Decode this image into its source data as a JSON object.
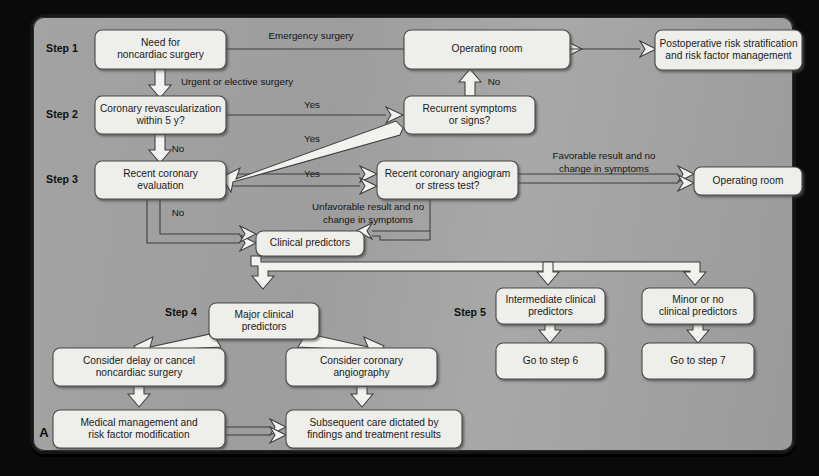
{
  "figure": {
    "panel_label": "A",
    "background_color": "#a0a0a0",
    "box_fill": "#eeeeea",
    "box_stroke": "#4a4a4a",
    "arrow_fill": "#f2f2ee"
  },
  "steps": [
    {
      "id": "step1",
      "label": "Step 1",
      "x": 62,
      "y": 49
    },
    {
      "id": "step2",
      "label": "Step 2",
      "x": 62,
      "y": 115
    },
    {
      "id": "step3",
      "label": "Step 3",
      "x": 62,
      "y": 180
    },
    {
      "id": "step4",
      "label": "Step 4",
      "x": 181,
      "y": 313
    },
    {
      "id": "step5",
      "label": "Step 5",
      "x": 470,
      "y": 313
    }
  ],
  "nodes": [
    {
      "id": "need",
      "lines": [
        "Need for",
        "noncardiac surgery"
      ],
      "x": 95,
      "y": 30,
      "w": 131,
      "h": 39
    },
    {
      "id": "or_top",
      "lines": [
        "Operating room"
      ],
      "x": 404,
      "y": 30,
      "w": 166,
      "h": 39
    },
    {
      "id": "postop",
      "lines": [
        "Postoperative risk stratification",
        "and risk factor management"
      ],
      "x": 655,
      "y": 30,
      "w": 147,
      "h": 40
    },
    {
      "id": "revasc",
      "lines": [
        "Coronary revascularization",
        "within 5 y?"
      ],
      "x": 95,
      "y": 96,
      "w": 131,
      "h": 38
    },
    {
      "id": "recurrent",
      "lines": [
        "Recurrent symptoms",
        "or signs?"
      ],
      "x": 404,
      "y": 96,
      "w": 131,
      "h": 38
    },
    {
      "id": "recentcor",
      "lines": [
        "Recent coronary",
        "evaluation"
      ],
      "x": 95,
      "y": 161,
      "w": 131,
      "h": 38
    },
    {
      "id": "angiogram",
      "lines": [
        "Recent coronary angiogram",
        "or stress test?"
      ],
      "x": 377,
      "y": 161,
      "w": 141,
      "h": 38
    },
    {
      "id": "or_right",
      "lines": [
        "Operating room"
      ],
      "x": 694,
      "y": 167,
      "w": 108,
      "h": 28
    },
    {
      "id": "clinpred",
      "lines": [
        "Clinical predictors"
      ],
      "x": 256,
      "y": 231,
      "w": 108,
      "h": 25
    },
    {
      "id": "major",
      "lines": [
        "Major clinical",
        "predictors"
      ],
      "x": 209,
      "y": 303,
      "w": 110,
      "h": 36
    },
    {
      "id": "intermediate",
      "lines": [
        "Intermediate clinical",
        "predictors"
      ],
      "x": 496,
      "y": 288,
      "w": 109,
      "h": 36
    },
    {
      "id": "minor",
      "lines": [
        "Minor or no",
        "clinical predictors"
      ],
      "x": 642,
      "y": 288,
      "w": 112,
      "h": 36
    },
    {
      "id": "delay",
      "lines": [
        "Consider delay or cancel",
        "noncardiac surgery"
      ],
      "x": 53,
      "y": 348,
      "w": 172,
      "h": 38
    },
    {
      "id": "coroangio",
      "lines": [
        "Consider coronary",
        "angiography"
      ],
      "x": 286,
      "y": 348,
      "w": 151,
      "h": 38
    },
    {
      "id": "gostep6",
      "lines": [
        "Go to step 6"
      ],
      "x": 496,
      "y": 343,
      "w": 109,
      "h": 36
    },
    {
      "id": "gostep7",
      "lines": [
        "Go to step 7"
      ],
      "x": 642,
      "y": 343,
      "w": 112,
      "h": 36
    },
    {
      "id": "medmgmt",
      "lines": [
        "Medical management and",
        "risk factor modification"
      ],
      "x": 53,
      "y": 410,
      "w": 172,
      "h": 38
    },
    {
      "id": "subsequent",
      "lines": [
        "Subsequent care dictated by",
        "findings and treatment results"
      ],
      "x": 286,
      "y": 410,
      "w": 176,
      "h": 38
    }
  ],
  "edge_labels": [
    {
      "id": "emergency",
      "lines": [
        "Emergency surgery"
      ],
      "x": 311,
      "y": 36
    },
    {
      "id": "urgent",
      "lines": [
        "Urgent or elective surgery"
      ],
      "x": 237,
      "y": 82
    },
    {
      "id": "yes1",
      "lines": [
        "Yes"
      ],
      "x": 312,
      "y": 105
    },
    {
      "id": "yes2",
      "lines": [
        "Yes"
      ],
      "x": 312,
      "y": 139
    },
    {
      "id": "no_revasc",
      "lines": [
        "No"
      ],
      "x": 178,
      "y": 149
    },
    {
      "id": "no_recurrent",
      "lines": [
        "No"
      ],
      "x": 494,
      "y": 82
    },
    {
      "id": "yes3",
      "lines": [
        "Yes"
      ],
      "x": 312,
      "y": 174
    },
    {
      "id": "favorable",
      "lines": [
        "Favorable result and no",
        "change in symptoms"
      ],
      "x": 604,
      "y": 163
    },
    {
      "id": "unfavorable",
      "lines": [
        "Unfavorable result and no",
        "change in symptoms"
      ],
      "x": 368,
      "y": 214
    },
    {
      "id": "no_recent",
      "lines": [
        "No"
      ],
      "x": 178,
      "y": 213
    }
  ]
}
